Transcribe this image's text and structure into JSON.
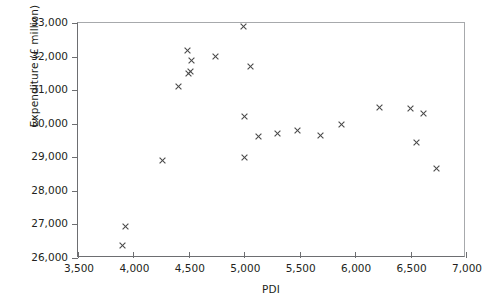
{
  "chart_data": {
    "type": "scatter",
    "title": "",
    "xlabel": "PDI",
    "ylabel": "Expenditure (£ million)",
    "xlim": [
      3500,
      7000
    ],
    "ylim": [
      26000,
      33000
    ],
    "xticks": [
      "3,500",
      "4,000",
      "4,500",
      "5,000",
      "5,500",
      "6,000",
      "6,500",
      "7,000"
    ],
    "xtick_values": [
      3500,
      4000,
      4500,
      5000,
      5500,
      6000,
      6500,
      7000
    ],
    "yticks": [
      "26,000",
      "27,000",
      "28,000",
      "29,000",
      "30,000",
      "31,000",
      "32,000",
      "33,000"
    ],
    "ytick_values": [
      26000,
      27000,
      28000,
      29000,
      30000,
      31000,
      32000,
      33000
    ],
    "grid": false,
    "legend": null,
    "marker": "x",
    "marker_color": "#4a4a4a",
    "series": [
      {
        "name": "Expenditure vs PDI",
        "points": [
          {
            "x": 3900,
            "y": 26360
          },
          {
            "x": 3930,
            "y": 26950
          },
          {
            "x": 4260,
            "y": 28890
          },
          {
            "x": 4410,
            "y": 31120
          },
          {
            "x": 4490,
            "y": 32180
          },
          {
            "x": 4500,
            "y": 31500
          },
          {
            "x": 4515,
            "y": 31550
          },
          {
            "x": 4520,
            "y": 31870
          },
          {
            "x": 4740,
            "y": 31990
          },
          {
            "x": 4995,
            "y": 32890
          },
          {
            "x": 5000,
            "y": 30220
          },
          {
            "x": 5000,
            "y": 29000
          },
          {
            "x": 5055,
            "y": 31690
          },
          {
            "x": 5125,
            "y": 29630
          },
          {
            "x": 5300,
            "y": 29700
          },
          {
            "x": 5480,
            "y": 29810
          },
          {
            "x": 5690,
            "y": 29640
          },
          {
            "x": 5880,
            "y": 29980
          },
          {
            "x": 6220,
            "y": 30490
          },
          {
            "x": 6500,
            "y": 30450
          },
          {
            "x": 6555,
            "y": 29440
          },
          {
            "x": 6620,
            "y": 30290
          },
          {
            "x": 6730,
            "y": 28680
          }
        ]
      }
    ]
  }
}
